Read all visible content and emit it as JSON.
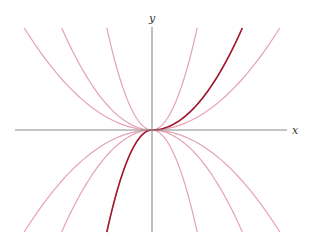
{
  "chart_data": {
    "type": "line",
    "title": "",
    "xlabel": "x",
    "ylabel": "y",
    "grid": false,
    "legend": null,
    "xlim": [
      -3.4,
      3.4
    ],
    "ylim": [
      -2.55,
      2.55
    ],
    "series": [
      {
        "name": "y = 2x^2",
        "c": 2,
        "domain": [
          -3.4,
          3.4
        ],
        "highlight": false
      },
      {
        "name": "y = (1/2)x^2",
        "c": 0.5,
        "domain": [
          -3.4,
          3.4
        ],
        "highlight": false
      },
      {
        "name": "y = (1/4)x^2",
        "c": 0.25,
        "domain": [
          -3.4,
          3.4
        ],
        "highlight": false
      },
      {
        "name": "y = -2x^2",
        "c": -2,
        "domain": [
          -3.4,
          3.4
        ],
        "highlight": false
      },
      {
        "name": "y = -(1/2)x^2",
        "c": -0.5,
        "domain": [
          -3.4,
          3.4
        ],
        "highlight": false
      },
      {
        "name": "y = -(1/4)x^2",
        "c": -0.25,
        "domain": [
          -3.4,
          3.4
        ],
        "highlight": false
      },
      {
        "name": "highlighted right branch y = (1/2)x^2, x >= 0",
        "c": 0.5,
        "domain": [
          0,
          3.4
        ],
        "highlight": true
      },
      {
        "name": "highlighted left branch y = -2x^2, x <= 0",
        "c": -2,
        "domain": [
          -3.4,
          0
        ],
        "highlight": true
      }
    ]
  },
  "axes": {
    "x_label": "x",
    "y_label": "y"
  },
  "colors": {
    "axis": "#8a8a8a",
    "family_curve": "#e3a3b3",
    "highlight_curve": "#a0192f"
  },
  "layout": {
    "origin_px": [
      152,
      130
    ],
    "px_per_unit": 40,
    "x_axis_px": [
      15,
      287
    ],
    "y_axis_px": [
      27,
      232
    ]
  }
}
